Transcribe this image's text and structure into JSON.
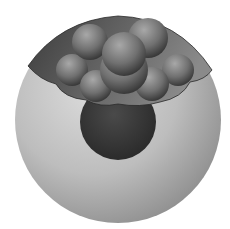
{
  "scene": {
    "description": "3D space-filling molecular model partially embedded in a translucent sphere",
    "colors": {
      "background": "#ffffff",
      "outer_sphere_light": "#d4d4d4",
      "outer_sphere_mid": "#b4b4b4",
      "outer_sphere_dark": "#8a8a8a",
      "cap_surface": "#5a5a5a",
      "atom_light": "#9a9a9a",
      "atom_mid": "#6e6e6e",
      "atom_dark": "#3e3e3e",
      "inner_sphere": "#3a3a3a"
    }
  }
}
